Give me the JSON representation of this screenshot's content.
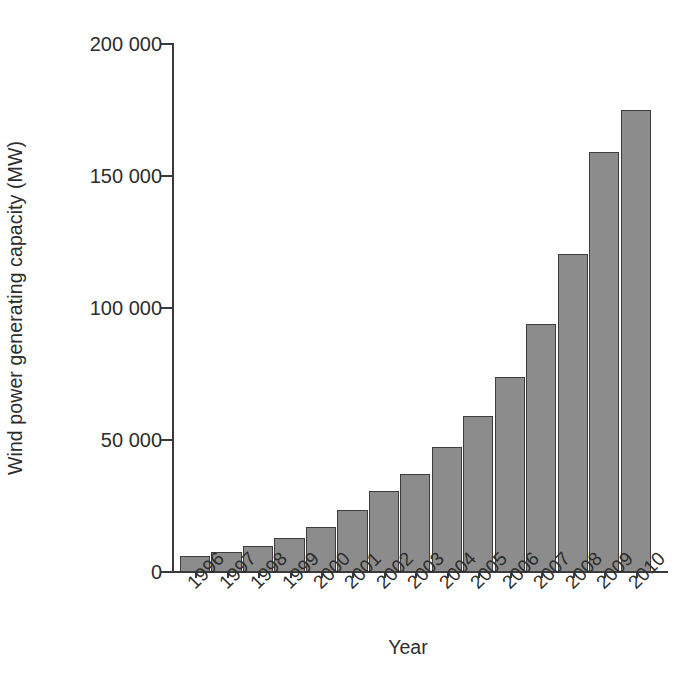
{
  "chart_data": {
    "type": "bar",
    "title": "",
    "xlabel": "Year",
    "ylabel": "Wind power generating capacity (MW)",
    "categories": [
      "1996",
      "1997",
      "1998",
      "1999",
      "2000",
      "2001",
      "2002",
      "2003",
      "2004",
      "2005",
      "2006",
      "2007",
      "2008",
      "2009",
      "2010"
    ],
    "values": [
      6000,
      7500,
      10000,
      13000,
      17000,
      23500,
      30500,
      37000,
      47500,
      59000,
      74000,
      94000,
      120500,
      159000,
      175000
    ],
    "series": [
      {
        "name": "Wind power generating capacity (MW)",
        "values": [
          6000,
          7500,
          10000,
          13000,
          17000,
          23500,
          30500,
          37000,
          47500,
          59000,
          74000,
          94000,
          120500,
          159000,
          175000
        ]
      }
    ],
    "ylim": [
      0,
      200000
    ],
    "ytick_values": [
      0,
      50000,
      100000,
      150000,
      200000
    ],
    "ytick_labels": [
      "0",
      "50 000",
      "100 000",
      "150 000",
      "200 000"
    ],
    "xtick_labels": [
      "1996",
      "1997",
      "1998",
      "1999",
      "2000",
      "2001",
      "2002",
      "2003",
      "2004",
      "2005",
      "2006",
      "2007",
      "2008",
      "2009",
      "2010"
    ],
    "xtick_label_rotation": -45,
    "grid": false,
    "legend": false,
    "legend_position": "none",
    "bar_fill_color": "#8c8c8c",
    "bar_edge_color": "#3d3d3d",
    "axis_color": "#3a3a3a",
    "background_color": "#ffffff",
    "annotations": []
  },
  "axes": {
    "y_title": "Wind power generating capacity (MW)",
    "x_title": "Year"
  },
  "caption": {
    "text": ""
  }
}
